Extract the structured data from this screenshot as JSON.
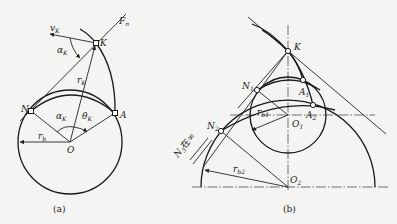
{
  "figure_a": {
    "caption": "(a)",
    "labels": {
      "F": "F",
      "F_sub": "n",
      "v": "v",
      "v_sub": "K",
      "alpha_top": "α",
      "alpha_top_sub": "K",
      "K": "K",
      "r": "r",
      "r_sub": "K",
      "N": "N",
      "alpha": "α",
      "alpha_sub": "K",
      "theta": "θ",
      "theta_sub": "K",
      "A": "A",
      "rb": "r",
      "rb_sub": "b",
      "O": "O"
    }
  },
  "figure_b": {
    "caption": "(b)",
    "labels": {
      "K": "K",
      "N1": "N",
      "N1_sub": "1",
      "A1": "A",
      "A1_sub": "1",
      "rb1": "r",
      "rb1_sub": "b1",
      "O1": "O",
      "O1_sub": "1",
      "A2": "A",
      "A2_sub": "2",
      "N2": "N",
      "N2_sub": "2",
      "N3": "N",
      "N3_sub": "3",
      "N3_suffix": "在∞",
      "rb2": "r",
      "rb2_sub": "b2",
      "O2": "O",
      "O2_sub": "2"
    }
  }
}
